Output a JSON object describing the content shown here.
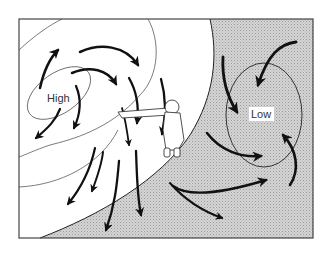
{
  "diagram": {
    "type": "weather-pressure-wind-diagram",
    "colors": {
      "background": "#ffffff",
      "low_region_fill": "#cfcfcf",
      "frame": "#444444",
      "isobar": "#333333",
      "arrow": "#111111"
    },
    "labels": {
      "high": "High",
      "low": "Low"
    },
    "elements": {
      "high_pressure_center": "High",
      "low_pressure_center": "Low",
      "figure": "person-pointing-toward-high-with-back-to-wind"
    }
  }
}
